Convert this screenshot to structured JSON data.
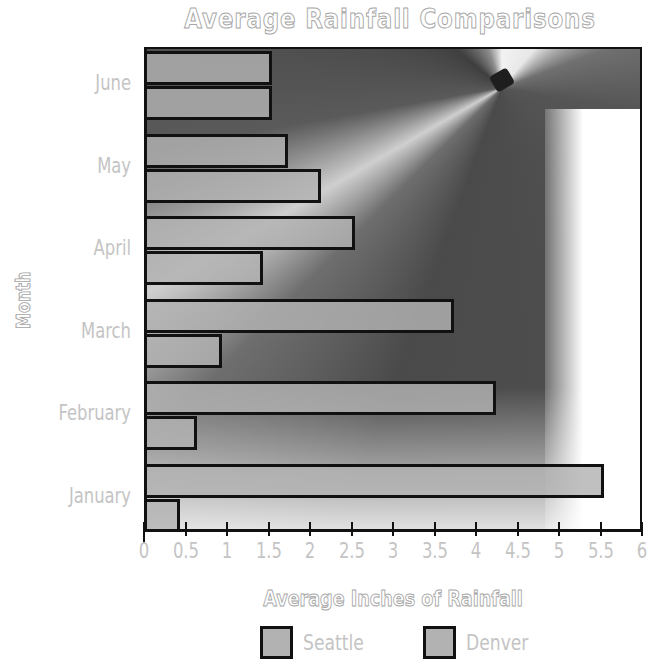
{
  "title": "Average Rainfall Comparisons",
  "x_axis_title": "Average Inches of Rainfall",
  "y_axis_title": "Month",
  "x_ticks": [
    "0",
    "0.5",
    "1",
    "1.5",
    "2",
    "2.5",
    "3",
    "3.5",
    "4",
    "4.5",
    "5",
    "5.5",
    "6"
  ],
  "months": [
    "June",
    "May",
    "April",
    "March",
    "February",
    "January"
  ],
  "legend": [
    {
      "label": "Seattle",
      "color": "#b2b2b2"
    },
    {
      "label": "Denver",
      "color": "#b2b2b2"
    }
  ],
  "chart_data": {
    "type": "bar",
    "orientation": "horizontal",
    "title": "Average Rainfall Comparisons",
    "xlabel": "Average Inches of Rainfall",
    "ylabel": "Month",
    "categories": [
      "January",
      "February",
      "March",
      "April",
      "May",
      "June"
    ],
    "series": [
      {
        "name": "Seattle",
        "values": [
          5.5,
          4.2,
          3.7,
          2.5,
          1.7,
          1.5
        ]
      },
      {
        "name": "Denver",
        "values": [
          0.4,
          0.6,
          0.9,
          1.4,
          2.1,
          1.5
        ]
      }
    ],
    "xlim": [
      0,
      6
    ],
    "x_tick_step": 0.5,
    "grid": false,
    "legend_position": "bottom",
    "background": "photo of umbrella underside (grayscale)"
  }
}
